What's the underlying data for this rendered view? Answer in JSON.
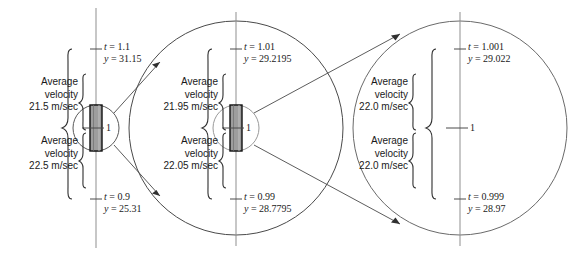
{
  "figure": {
    "panels": [
      {
        "id": "panel-left",
        "top_point": {
          "t_label": "t = 1.1",
          "y_label": "y = 31.15"
        },
        "bottom_point": {
          "t_label": "t = 0.9",
          "y_label": "y = 25.31"
        },
        "center_tick_label": "1",
        "upper_bracket": {
          "line1": "Average",
          "line2": "velocity",
          "line3": "21.5 m/sec"
        },
        "lower_bracket": {
          "line1": "Average",
          "line2": "velocity",
          "line3": "22.5 m/sec"
        }
      },
      {
        "id": "panel-middle",
        "top_point": {
          "t_label": "t = 1.01",
          "y_label": "y = 29.2195"
        },
        "bottom_point": {
          "t_label": "t = 0.99",
          "y_label": "y = 28.7795"
        },
        "center_tick_label": "1",
        "upper_bracket": {
          "line1": "Average",
          "line2": "velocity",
          "line3": "21.95 m/sec"
        },
        "lower_bracket": {
          "line1": "Average",
          "line2": "velocity",
          "line3": "22.05 m/sec"
        }
      },
      {
        "id": "panel-right",
        "top_point": {
          "t_label": "t = 1.001",
          "y_label": "y = 29.022"
        },
        "bottom_point": {
          "t_label": "t = 0.999",
          "y_label": "y = 28.97"
        },
        "center_tick_label": "1",
        "upper_bracket": {
          "line1": "Average",
          "line2": "velocity",
          "line3": "22.0 m/sec"
        },
        "lower_bracket": {
          "line1": "Average",
          "line2": "velocity",
          "line3": "22.0 m/sec"
        }
      }
    ],
    "colors": {
      "stroke": "#3b3b3b",
      "axis": "#8a8a8a",
      "highlight_fill": "#9b9b9b",
      "highlight_stroke": "#111111",
      "text": "#1a1a1a"
    }
  },
  "chart_data": {
    "type": "diagram",
    "xlabel": "t (sec)",
    "ylabel": "y (m)",
    "series": [
      {
        "name": "panel-left",
        "t_values": [
          0.9,
          1.0,
          1.1
        ],
        "y_values": [
          25.31,
          null,
          31.15
        ],
        "avg_velocity_upper": 21.5,
        "avg_velocity_lower": 22.5,
        "units": "m/sec"
      },
      {
        "name": "panel-middle",
        "t_values": [
          0.99,
          1.0,
          1.01
        ],
        "y_values": [
          28.7795,
          null,
          29.2195
        ],
        "avg_velocity_upper": 21.95,
        "avg_velocity_lower": 22.05,
        "units": "m/sec"
      },
      {
        "name": "panel-right",
        "t_values": [
          0.999,
          1.0,
          1.001
        ],
        "y_values": [
          28.97,
          null,
          29.022
        ],
        "avg_velocity_upper": 22.0,
        "avg_velocity_lower": 22.0,
        "units": "m/sec"
      }
    ]
  }
}
